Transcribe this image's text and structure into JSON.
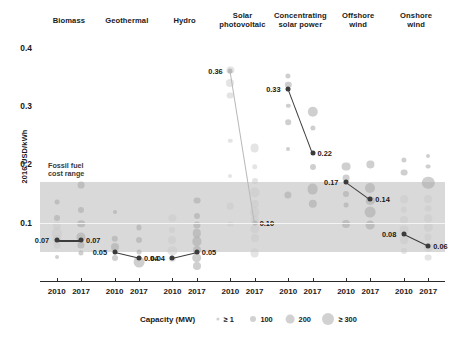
{
  "chart_data": {
    "type": "scatter",
    "title": "",
    "ylabel": "2016 USD/kWh",
    "xlabel": "",
    "ylim": [
      0.0,
      0.42
    ],
    "yticks": [
      "0.1",
      "0.2",
      "0.3",
      "0.4"
    ],
    "ytick_values": [
      0.1,
      0.2,
      0.3,
      0.4
    ],
    "grid": false,
    "legend_position": "bottom",
    "size_legend": {
      "title": "Capacity (MW)",
      "entries": [
        {
          "label": "≥ 1",
          "value": 1
        },
        {
          "label": "100",
          "value": 100
        },
        {
          "label": "200",
          "value": 200
        },
        {
          "label": "≥ 300",
          "value": 300
        }
      ]
    },
    "fossil_band": {
      "label_line1": "Fossil fuel",
      "label_line2": "cost range",
      "low": 0.05,
      "high": 0.17
    },
    "categories": [
      {
        "name": "Biomass",
        "name_line1": "Biomass",
        "name_line2": "",
        "x_labels": [
          "2010",
          "2017"
        ],
        "start_value": 0.07,
        "end_value": 0.07,
        "start_label": "0.07",
        "end_label": "0.07",
        "trend_style": "dark"
      },
      {
        "name": "Geothermal",
        "name_line1": "Geothermal",
        "name_line2": "",
        "x_labels": [
          "2010",
          "2017"
        ],
        "start_value": 0.05,
        "end_value": 0.04,
        "start_label": "0.05",
        "end_label": "0.04",
        "trend_style": "dark"
      },
      {
        "name": "Hydro",
        "name_line1": "Hydro",
        "name_line2": "",
        "x_labels": [
          "2010",
          "2017"
        ],
        "start_value": 0.04,
        "end_value": 0.05,
        "start_label": "0.04",
        "end_label": "0.05",
        "trend_style": "dark"
      },
      {
        "name": "Solar photovoltaic",
        "name_line1": "Solar",
        "name_line2": "photovoltaic",
        "x_labels": [
          "2010",
          "2017"
        ],
        "start_value": 0.36,
        "end_value": 0.1,
        "start_label": "0.36",
        "end_label": "0.10",
        "trend_style": "light"
      },
      {
        "name": "Concentrating solar power",
        "name_line1": "Concentrating",
        "name_line2": "solar power",
        "x_labels": [
          "2010",
          "2017"
        ],
        "start_value": 0.33,
        "end_value": 0.22,
        "start_label": "0.33",
        "end_label": "0.22",
        "trend_style": "dark"
      },
      {
        "name": "Offshore wind",
        "name_line1": "Offshore",
        "name_line2": "wind",
        "x_labels": [
          "2010",
          "2017"
        ],
        "start_value": 0.17,
        "end_value": 0.14,
        "start_label": "0.17",
        "end_label": "0.14",
        "trend_style": "dark"
      },
      {
        "name": "Onshore wind",
        "name_line1": "Onshore",
        "name_line2": "wind",
        "x_labels": [
          "2010",
          "2017"
        ],
        "start_value": 0.08,
        "end_value": 0.06,
        "start_label": "0.08",
        "end_label": "0.06",
        "trend_style": "dark"
      }
    ],
    "colors": {
      "bubble": "#a8a8a8",
      "bubble_dark": "#6f6f6f",
      "band": "#d9d9d9",
      "trend_dark": "#3c3c3c",
      "trend_light": "#b9b9b9",
      "axis": "#2b2b2b",
      "text": "#1a1a1a"
    },
    "bubbles": [
      {
        "c": 0,
        "s": 0,
        "v": 0.135,
        "r": 2.4,
        "t": "n"
      },
      {
        "c": 0,
        "s": 0,
        "v": 0.108,
        "r": 3.0,
        "t": "n"
      },
      {
        "c": 0,
        "s": 0,
        "v": 0.095,
        "r": 4.2,
        "t": "l"
      },
      {
        "c": 0,
        "s": 0,
        "v": 0.082,
        "r": 5.2,
        "t": "l"
      },
      {
        "c": 0,
        "s": 0,
        "v": 0.072,
        "r": 4.6,
        "t": "l"
      },
      {
        "c": 0,
        "s": 0,
        "v": 0.062,
        "r": 3.4,
        "t": "l"
      },
      {
        "c": 0,
        "s": 0,
        "v": 0.042,
        "r": 2.0,
        "t": "n"
      },
      {
        "c": 0,
        "s": 1,
        "v": 0.165,
        "r": 3.4,
        "t": "n"
      },
      {
        "c": 0,
        "s": 1,
        "v": 0.122,
        "r": 3.0,
        "t": "n"
      },
      {
        "c": 0,
        "s": 1,
        "v": 0.098,
        "r": 3.8,
        "t": "n"
      },
      {
        "c": 0,
        "s": 1,
        "v": 0.075,
        "r": 4.6,
        "t": "n"
      },
      {
        "c": 0,
        "s": 1,
        "v": 0.062,
        "r": 3.6,
        "t": "n"
      },
      {
        "c": 0,
        "s": 1,
        "v": 0.048,
        "r": 2.6,
        "t": "n"
      },
      {
        "c": 1,
        "s": 0,
        "v": 0.118,
        "r": 2.0,
        "t": "n"
      },
      {
        "c": 1,
        "s": 0,
        "v": 0.072,
        "r": 3.2,
        "t": "n"
      },
      {
        "c": 1,
        "s": 0,
        "v": 0.058,
        "r": 4.0,
        "t": "n"
      },
      {
        "c": 1,
        "s": 0,
        "v": 0.04,
        "r": 3.0,
        "t": "n"
      },
      {
        "c": 1,
        "s": 1,
        "v": 0.092,
        "r": 2.6,
        "t": "n"
      },
      {
        "c": 1,
        "s": 1,
        "v": 0.07,
        "r": 3.0,
        "t": "n"
      },
      {
        "c": 1,
        "s": 1,
        "v": 0.05,
        "r": 2.4,
        "t": "n"
      },
      {
        "c": 1,
        "s": 1,
        "v": 0.032,
        "r": 5.4,
        "t": "n"
      },
      {
        "c": 2,
        "s": 0,
        "v": 0.108,
        "r": 3.6,
        "t": "l"
      },
      {
        "c": 2,
        "s": 0,
        "v": 0.088,
        "r": 3.0,
        "t": "l"
      },
      {
        "c": 2,
        "s": 0,
        "v": 0.07,
        "r": 4.0,
        "t": "l"
      },
      {
        "c": 2,
        "s": 0,
        "v": 0.052,
        "r": 4.6,
        "t": "l"
      },
      {
        "c": 2,
        "s": 0,
        "v": 0.038,
        "r": 3.2,
        "t": "l"
      },
      {
        "c": 2,
        "s": 1,
        "v": 0.138,
        "r": 3.4,
        "t": "n"
      },
      {
        "c": 2,
        "s": 1,
        "v": 0.112,
        "r": 3.0,
        "t": "n"
      },
      {
        "c": 2,
        "s": 1,
        "v": 0.096,
        "r": 3.6,
        "t": "n"
      },
      {
        "c": 2,
        "s": 1,
        "v": 0.082,
        "r": 4.2,
        "t": "n"
      },
      {
        "c": 2,
        "s": 1,
        "v": 0.068,
        "r": 4.6,
        "t": "n"
      },
      {
        "c": 2,
        "s": 1,
        "v": 0.054,
        "r": 4.0,
        "t": "n"
      },
      {
        "c": 2,
        "s": 1,
        "v": 0.04,
        "r": 4.8,
        "t": "n"
      },
      {
        "c": 2,
        "s": 1,
        "v": 0.026,
        "r": 4.0,
        "t": "n"
      },
      {
        "c": 3,
        "s": 0,
        "v": 0.362,
        "r": 3.6,
        "t": "l"
      },
      {
        "c": 3,
        "s": 0,
        "v": 0.34,
        "r": 4.0,
        "t": "l"
      },
      {
        "c": 3,
        "s": 0,
        "v": 0.318,
        "r": 3.4,
        "t": "l"
      },
      {
        "c": 3,
        "s": 0,
        "v": 0.24,
        "r": 2.2,
        "t": "l"
      },
      {
        "c": 3,
        "s": 0,
        "v": 0.18,
        "r": 2.0,
        "t": "l"
      },
      {
        "c": 3,
        "s": 0,
        "v": 0.128,
        "r": 3.4,
        "t": "l"
      },
      {
        "c": 3,
        "s": 0,
        "v": 0.098,
        "r": 2.6,
        "t": "l"
      },
      {
        "c": 3,
        "s": 1,
        "v": 0.228,
        "r": 4.4,
        "t": "l"
      },
      {
        "c": 3,
        "s": 1,
        "v": 0.196,
        "r": 2.8,
        "t": "l"
      },
      {
        "c": 3,
        "s": 1,
        "v": 0.172,
        "r": 3.0,
        "t": "l"
      },
      {
        "c": 3,
        "s": 1,
        "v": 0.152,
        "r": 4.6,
        "t": "l"
      },
      {
        "c": 3,
        "s": 1,
        "v": 0.132,
        "r": 4.0,
        "t": "l"
      },
      {
        "c": 3,
        "s": 1,
        "v": 0.118,
        "r": 4.8,
        "t": "l"
      },
      {
        "c": 3,
        "s": 1,
        "v": 0.104,
        "r": 4.2,
        "t": "l"
      },
      {
        "c": 3,
        "s": 1,
        "v": 0.09,
        "r": 4.6,
        "t": "l"
      },
      {
        "c": 3,
        "s": 1,
        "v": 0.074,
        "r": 4.0,
        "t": "l"
      },
      {
        "c": 3,
        "s": 1,
        "v": 0.048,
        "r": 4.4,
        "t": "l"
      },
      {
        "c": 4,
        "s": 0,
        "v": 0.352,
        "r": 2.6,
        "t": "n"
      },
      {
        "c": 4,
        "s": 0,
        "v": 0.336,
        "r": 3.2,
        "t": "n"
      },
      {
        "c": 4,
        "s": 0,
        "v": 0.3,
        "r": 2.2,
        "t": "n"
      },
      {
        "c": 4,
        "s": 0,
        "v": 0.272,
        "r": 2.8,
        "t": "n"
      },
      {
        "c": 4,
        "s": 0,
        "v": 0.226,
        "r": 2.0,
        "t": "n"
      },
      {
        "c": 4,
        "s": 0,
        "v": 0.148,
        "r": 3.6,
        "t": "n"
      },
      {
        "c": 4,
        "s": 1,
        "v": 0.29,
        "r": 5.2,
        "t": "n"
      },
      {
        "c": 4,
        "s": 1,
        "v": 0.262,
        "r": 2.6,
        "t": "n"
      },
      {
        "c": 4,
        "s": 1,
        "v": 0.196,
        "r": 3.0,
        "t": "n"
      },
      {
        "c": 4,
        "s": 1,
        "v": 0.158,
        "r": 5.4,
        "t": "n"
      },
      {
        "c": 4,
        "s": 1,
        "v": 0.132,
        "r": 4.2,
        "t": "n"
      },
      {
        "c": 5,
        "s": 0,
        "v": 0.196,
        "r": 4.4,
        "t": "n"
      },
      {
        "c": 5,
        "s": 0,
        "v": 0.176,
        "r": 3.4,
        "t": "n"
      },
      {
        "c": 5,
        "s": 0,
        "v": 0.15,
        "r": 3.0,
        "t": "n"
      },
      {
        "c": 5,
        "s": 0,
        "v": 0.13,
        "r": 2.4,
        "t": "n"
      },
      {
        "c": 5,
        "s": 0,
        "v": 0.098,
        "r": 4.0,
        "t": "n"
      },
      {
        "c": 5,
        "s": 1,
        "v": 0.2,
        "r": 3.6,
        "t": "n"
      },
      {
        "c": 5,
        "s": 1,
        "v": 0.16,
        "r": 5.0,
        "t": "n"
      },
      {
        "c": 5,
        "s": 1,
        "v": 0.138,
        "r": 4.2,
        "t": "n"
      },
      {
        "c": 5,
        "s": 1,
        "v": 0.118,
        "r": 5.4,
        "t": "n"
      },
      {
        "c": 5,
        "s": 1,
        "v": 0.096,
        "r": 4.4,
        "t": "n"
      },
      {
        "c": 6,
        "s": 0,
        "v": 0.208,
        "r": 2.6,
        "t": "n"
      },
      {
        "c": 6,
        "s": 0,
        "v": 0.186,
        "r": 3.4,
        "t": "n"
      },
      {
        "c": 6,
        "s": 0,
        "v": 0.14,
        "r": 3.8,
        "t": "l"
      },
      {
        "c": 6,
        "s": 0,
        "v": 0.122,
        "r": 3.2,
        "t": "l"
      },
      {
        "c": 6,
        "s": 0,
        "v": 0.104,
        "r": 4.0,
        "t": "l"
      },
      {
        "c": 6,
        "s": 0,
        "v": 0.088,
        "r": 4.4,
        "t": "l"
      },
      {
        "c": 6,
        "s": 0,
        "v": 0.07,
        "r": 3.8,
        "t": "l"
      },
      {
        "c": 6,
        "s": 0,
        "v": 0.052,
        "r": 3.0,
        "t": "l"
      },
      {
        "c": 6,
        "s": 1,
        "v": 0.214,
        "r": 2.0,
        "t": "n"
      },
      {
        "c": 6,
        "s": 1,
        "v": 0.196,
        "r": 2.4,
        "t": "n"
      },
      {
        "c": 6,
        "s": 1,
        "v": 0.168,
        "r": 6.2,
        "t": "n"
      },
      {
        "c": 6,
        "s": 1,
        "v": 0.14,
        "r": 4.0,
        "t": "l"
      },
      {
        "c": 6,
        "s": 1,
        "v": 0.124,
        "r": 3.4,
        "t": "l"
      },
      {
        "c": 6,
        "s": 1,
        "v": 0.108,
        "r": 3.8,
        "t": "l"
      },
      {
        "c": 6,
        "s": 1,
        "v": 0.092,
        "r": 4.2,
        "t": "l"
      },
      {
        "c": 6,
        "s": 1,
        "v": 0.076,
        "r": 3.6,
        "t": "l"
      },
      {
        "c": 6,
        "s": 1,
        "v": 0.058,
        "r": 4.2,
        "t": "l"
      },
      {
        "c": 6,
        "s": 1,
        "v": 0.04,
        "r": 3.4,
        "t": "l"
      }
    ]
  }
}
